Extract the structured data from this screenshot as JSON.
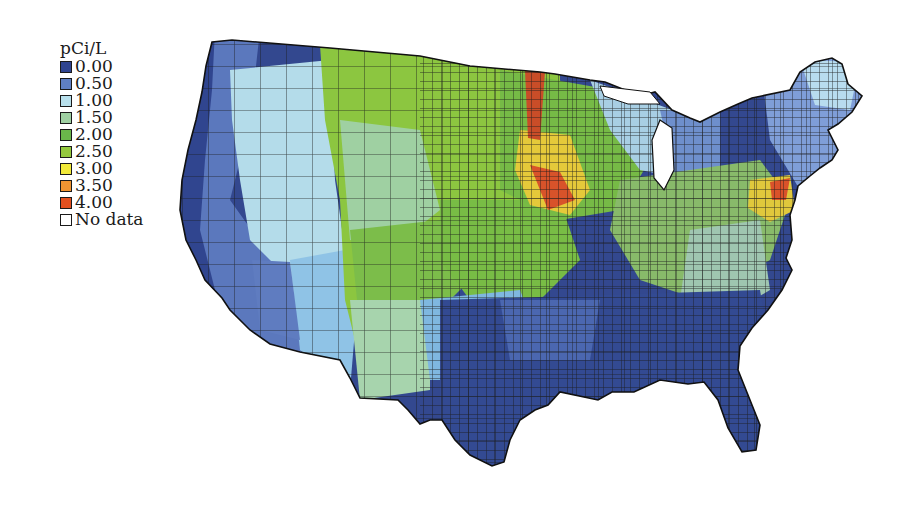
{
  "legend": {
    "title": "pCi/L",
    "items": [
      {
        "label": "0.00",
        "color": "#2f4490"
      },
      {
        "label": "0.50",
        "color": "#5f7fc4"
      },
      {
        "label": "1.00",
        "color": "#b8e0ec"
      },
      {
        "label": "1.50",
        "color": "#9fd0a2"
      },
      {
        "label": "2.00",
        "color": "#6ab64a"
      },
      {
        "label": "2.50",
        "color": "#94c93e"
      },
      {
        "label": "3.00",
        "color": "#f2ea3a"
      },
      {
        "label": "3.50",
        "color": "#ef9432"
      },
      {
        "label": "4.00",
        "color": "#e2501f"
      },
      {
        "label": "No data",
        "color": "#ffffff"
      }
    ]
  },
  "map": {
    "subject": "Contiguous United States county-level radon concentration (pCi/L)",
    "regions": [
      {
        "name": "pacific-coast",
        "dominant_level": "0.00-0.50"
      },
      {
        "name": "great-basin-southwest",
        "dominant_level": "0.50-1.00"
      },
      {
        "name": "northern-rockies-plains",
        "dominant_level": "1.50-2.50"
      },
      {
        "name": "upper-midwest-iowa",
        "dominant_level": "2.50-4.00"
      },
      {
        "name": "appalachia-pennsylvania",
        "dominant_level": "2.00-4.00"
      },
      {
        "name": "southeast-gulf",
        "dominant_level": "0.00-0.50"
      },
      {
        "name": "new-england",
        "dominant_level": "0.50-1.00"
      }
    ]
  }
}
